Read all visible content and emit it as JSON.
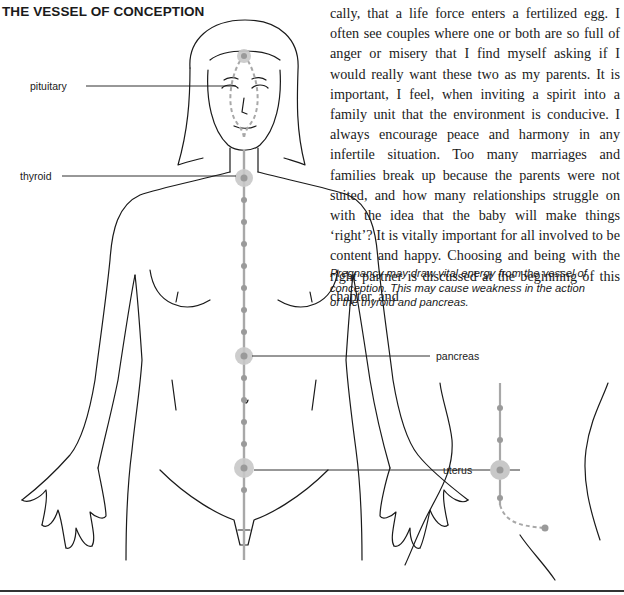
{
  "page": {
    "title": "THE VESSEL OF CONCEPTION",
    "body_text": "cally, that a life force enters a fertilized egg. I often see couples where one or both are so full of anger or misery that I find myself asking if I would really want these two as my parents. It is important, I feel, when inviting a spirit into a family unit that the environment is conducive. I always encourage peace and harmony in any infertile situation. Too many marriages and families break up because the parents were not suited, and how many relationships struggle on with the idea that the baby will make things ‘right’? It is vitally important for all involved to be content and happy. Choosing and being with the right partner is discussed at the beginning of this chapter, and",
    "caption": "Pregnancy may draw vital energy from the vessel of conception. This may cause weakness in the action of the thyroid and pancreas."
  },
  "illustration": {
    "labels": {
      "pituitary": "pituitary",
      "thyroid": "thyroid",
      "pancreas": "pancreas",
      "uterus": "uterus"
    },
    "colors": {
      "meridian": "#a8a8a8",
      "point_halo": "#c8c8c8",
      "outline": "#1a1a1a"
    }
  }
}
